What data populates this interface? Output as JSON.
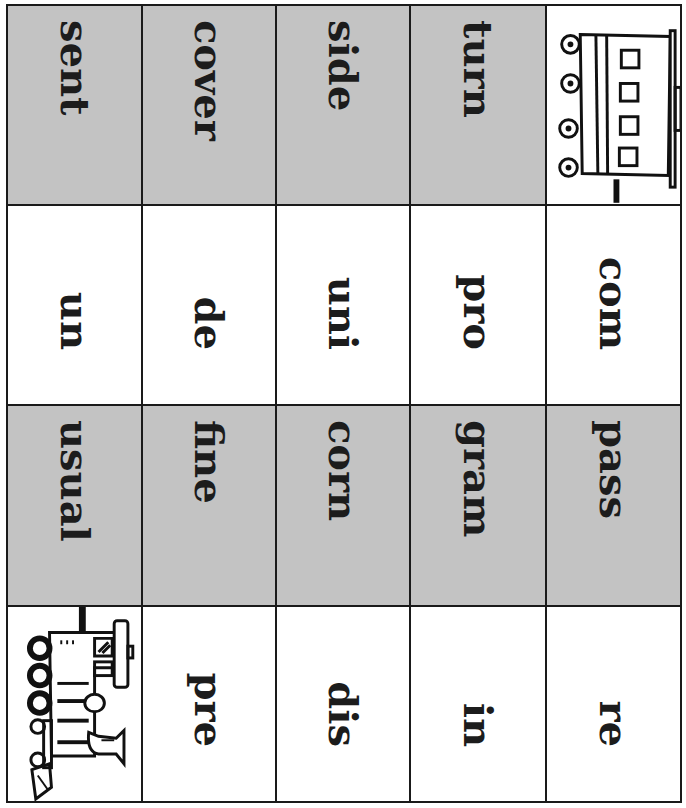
{
  "colors": {
    "grey_cell": "#c3c3c3",
    "white_cell": "#ffffff",
    "ink": "#1c1c1c"
  },
  "rows": [
    {
      "fill": "grey",
      "cells": [
        {
          "type": "word",
          "text": "sent"
        },
        {
          "type": "word",
          "text": "cover"
        },
        {
          "type": "word",
          "text": "side"
        },
        {
          "type": "word",
          "text": "turn"
        },
        {
          "type": "icon",
          "icon": "train-caboose-icon"
        }
      ]
    },
    {
      "fill": "white",
      "cells": [
        {
          "type": "word",
          "text": "un"
        },
        {
          "type": "word",
          "text": "de"
        },
        {
          "type": "word",
          "text": "uni"
        },
        {
          "type": "word",
          "text": "pro"
        },
        {
          "type": "word",
          "text": "com"
        }
      ]
    },
    {
      "fill": "grey",
      "cells": [
        {
          "type": "word",
          "text": "usual"
        },
        {
          "type": "word",
          "text": "fine"
        },
        {
          "type": "word",
          "text": "corn"
        },
        {
          "type": "word",
          "text": "gram"
        },
        {
          "type": "word",
          "text": "pass"
        }
      ]
    },
    {
      "fill": "white",
      "cells": [
        {
          "type": "icon",
          "icon": "train-engine-icon"
        },
        {
          "type": "word",
          "text": "pre"
        },
        {
          "type": "word",
          "text": "dis"
        },
        {
          "type": "word",
          "text": "in"
        },
        {
          "type": "word",
          "text": "re"
        }
      ]
    }
  ]
}
